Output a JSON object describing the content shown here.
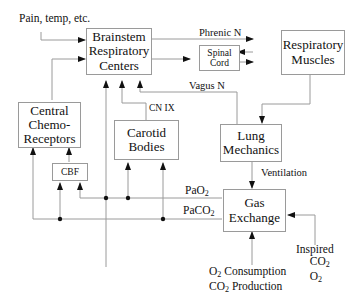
{
  "diagram": {
    "nodes": {
      "brainstem": {
        "line1": "Brainstem",
        "line2": "Respiratory",
        "line3": "Centers"
      },
      "spinal_cord": {
        "line1": "Spinal",
        "line2": "Cord"
      },
      "respiratory_muscles": {
        "line1": "Respiratory",
        "line2": "Muscles"
      },
      "central_chemoreceptors": {
        "line1": "Central",
        "line2": "Chemo-",
        "line3": "Receptors"
      },
      "carotid_bodies": {
        "line1": "Carotid",
        "line2": "Bodies"
      },
      "cbf": {
        "label": "CBF"
      },
      "lung_mechanics": {
        "line1": "Lung",
        "line2": "Mechanics"
      },
      "gas_exchange": {
        "line1": "Gas",
        "line2": "Exchange"
      }
    },
    "labels": {
      "pain_temp": "Pain, temp, etc.",
      "phrenic": "Phrenic N",
      "vagus": "Vagus N",
      "cn_ix": "CN IX",
      "ventilation": "Ventilation",
      "pao2": "PaO",
      "pao2_sub": "2",
      "paco2": "PaCO",
      "paco2_sub": "2",
      "o2_consumption_prefix": "O",
      "o2_consumption_sub": "2",
      "o2_consumption_text": " Consumption",
      "co2_production_prefix": "CO",
      "co2_production_sub": "2",
      "co2_production_text": " Production",
      "inspired": "Inspired",
      "inspired_co2": "CO",
      "inspired_co2_sub": "2",
      "inspired_o2": "O",
      "inspired_o2_sub": "2"
    },
    "colors": {
      "line": "#9a9a9a",
      "arrow": "#111111",
      "box_border": "#9a9a9a"
    }
  }
}
